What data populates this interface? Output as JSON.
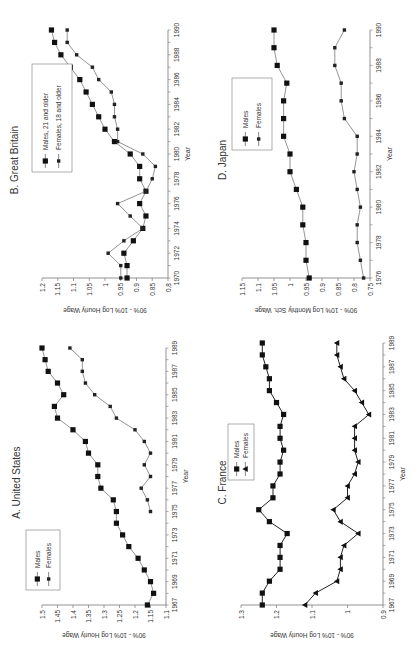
{
  "figure": {
    "orientation": "rotated-90-ccw"
  },
  "chart_data": [
    {
      "id": "us",
      "type": "line",
      "title": "A. United States",
      "xlabel": "Year",
      "ylabel": "90% - 10% Log Hourly Wage",
      "xlim": [
        1967,
        1989
      ],
      "ylim": [
        1.1,
        1.5
      ],
      "xticks": [
        1967,
        1969,
        1971,
        1973,
        1975,
        1977,
        1979,
        1981,
        1983,
        1985,
        1987,
        1989
      ],
      "yticks": [
        1.1,
        1.15,
        1.2,
        1.25,
        1.3,
        1.35,
        1.4,
        1.45,
        1.5
      ],
      "ytick_labels": [
        "1.1",
        "1.15",
        "1.2",
        "1.25",
        "1.3",
        "1.35",
        "1.4",
        "1.45",
        "1.5"
      ],
      "legend": [
        "Males",
        "Females"
      ],
      "legend_position": "bottom-left",
      "series": [
        {
          "name": "Males",
          "marker": "square",
          "x": [
            1967,
            1968,
            1969,
            1970,
            1971,
            1972,
            1973,
            1974,
            1975,
            1976,
            1977,
            1978,
            1979,
            1980,
            1981,
            1982,
            1983,
            1984,
            1985,
            1986,
            1987,
            1988,
            1989
          ],
          "values": [
            1.16,
            1.14,
            1.15,
            1.17,
            1.19,
            1.22,
            1.24,
            1.26,
            1.26,
            1.27,
            1.31,
            1.32,
            1.32,
            1.35,
            1.36,
            1.4,
            1.45,
            1.46,
            1.43,
            1.45,
            1.48,
            1.49,
            1.5
          ]
        },
        {
          "name": "Females",
          "marker": "small-diamond",
          "x": [
            1975,
            1976,
            1977,
            1978,
            1979,
            1980,
            1981,
            1982,
            1983,
            1984,
            1985,
            1986,
            1987,
            1988,
            1989
          ],
          "values": [
            1.15,
            1.16,
            1.18,
            1.15,
            1.17,
            1.15,
            1.17,
            1.2,
            1.26,
            1.28,
            1.33,
            1.36,
            1.37,
            1.37,
            1.41
          ]
        }
      ]
    },
    {
      "id": "gb",
      "type": "line",
      "title": "B. Great Britain",
      "xlabel": "Year",
      "ylabel": "90% - 10% Log Hourly Wage",
      "xlim": [
        1970,
        1990
      ],
      "ylim": [
        0.8,
        1.2
      ],
      "xticks": [
        1970,
        1972,
        1974,
        1976,
        1978,
        1980,
        1982,
        1984,
        1986,
        1988,
        1990
      ],
      "yticks": [
        0.8,
        0.85,
        0.9,
        0.95,
        1.0,
        1.05,
        1.1,
        1.15,
        1.2
      ],
      "ytick_labels": [
        "0.8",
        "0.85",
        "0.9",
        "0.95",
        "1",
        "1.05",
        "1.1",
        "1.15",
        "1.2"
      ],
      "legend": [
        "Males, 21 and older",
        "Females, 18 and older"
      ],
      "legend_position": "top-left",
      "series": [
        {
          "name": "Males, 21 and older",
          "marker": "square",
          "x": [
            1970,
            1971,
            1972,
            1973,
            1974,
            1975,
            1976,
            1977,
            1978,
            1979,
            1980,
            1981,
            1982,
            1983,
            1984,
            1985,
            1986,
            1987,
            1988,
            1989,
            1990
          ],
          "values": [
            0.93,
            0.93,
            0.94,
            0.91,
            0.88,
            0.87,
            0.89,
            0.87,
            0.89,
            0.89,
            0.92,
            0.97,
            1.0,
            1.02,
            1.04,
            1.06,
            1.08,
            1.11,
            1.14,
            1.16,
            1.17
          ]
        },
        {
          "name": "Females, 18 and older",
          "marker": "small-diamond",
          "x": [
            1970,
            1971,
            1972,
            1973,
            1974,
            1975,
            1976,
            1977,
            1978,
            1979,
            1980,
            1981,
            1982,
            1983,
            1984,
            1985,
            1986,
            1987,
            1988,
            1989,
            1990
          ],
          "values": [
            0.95,
            0.95,
            0.99,
            0.94,
            0.88,
            0.92,
            0.96,
            0.87,
            0.85,
            0.84,
            0.88,
            0.96,
            0.96,
            0.97,
            0.97,
            0.98,
            1.02,
            1.04,
            1.09,
            1.12,
            1.12
          ]
        }
      ]
    },
    {
      "id": "fr",
      "type": "line",
      "title": "C. France",
      "xlabel": "Year",
      "ylabel": "90% - 10% Log Hourly Wage",
      "xlim": [
        1967,
        1989
      ],
      "ylim": [
        0.9,
        1.3
      ],
      "xticks": [
        1967,
        1969,
        1971,
        1973,
        1975,
        1977,
        1979,
        1981,
        1983,
        1985,
        1987,
        1989
      ],
      "yticks": [
        0.9,
        1.0,
        1.1,
        1.2,
        1.3
      ],
      "ytick_labels": [
        "0.9",
        "1",
        "1.1",
        "1.2",
        "1.3"
      ],
      "legend": [
        "Males",
        "Females"
      ],
      "legend_position": "top-left",
      "series": [
        {
          "name": "Males",
          "marker": "square",
          "x": [
            1967,
            1968,
            1969,
            1970,
            1971,
            1972,
            1973,
            1974,
            1975,
            1976,
            1977,
            1978,
            1979,
            1980,
            1981,
            1982,
            1983,
            1984,
            1985,
            1986,
            1987,
            1988,
            1989
          ],
          "values": [
            1.24,
            1.24,
            1.22,
            1.19,
            1.19,
            1.19,
            1.17,
            1.22,
            1.25,
            1.21,
            1.21,
            1.19,
            1.19,
            1.18,
            1.19,
            1.19,
            1.18,
            1.2,
            1.22,
            1.22,
            1.23,
            1.24,
            1.24
          ]
        },
        {
          "name": "Females",
          "marker": "triangle",
          "x": [
            1967,
            1968,
            1969,
            1970,
            1971,
            1972,
            1973,
            1974,
            1975,
            1976,
            1977,
            1978,
            1979,
            1980,
            1981,
            1982,
            1983,
            1984,
            1985,
            1986,
            1987,
            1988,
            1989
          ],
          "values": [
            1.12,
            1.09,
            1.03,
            1.02,
            1.02,
            1.01,
            0.97,
            1.02,
            1.04,
            1.0,
            1.0,
            0.98,
            0.97,
            0.98,
            0.98,
            0.98,
            0.94,
            0.96,
            0.98,
            1.01,
            1.02,
            1.03,
            1.03
          ]
        }
      ]
    },
    {
      "id": "jp",
      "type": "line",
      "title": "D. Japan",
      "xlabel": "Year",
      "ylabel": "90% - 10% Log Monthly Sch. Wage",
      "xlim": [
        1976,
        1990
      ],
      "ylim": [
        0.75,
        1.15
      ],
      "xticks": [
        1976,
        1978,
        1980,
        1982,
        1984,
        1986,
        1988,
        1990
      ],
      "yticks": [
        0.75,
        0.8,
        0.85,
        0.9,
        0.95,
        1.0,
        1.05,
        1.1,
        1.15
      ],
      "ytick_labels": [
        "0.75",
        "0.8",
        "0.85",
        "0.9",
        "0.95",
        "1",
        "1.05",
        "1.1",
        "1.15"
      ],
      "legend": [
        "Males",
        "Females"
      ],
      "legend_position": "top-left",
      "series": [
        {
          "name": "Males",
          "marker": "square",
          "x": [
            1976,
            1977,
            1978,
            1979,
            1980,
            1981,
            1982,
            1983,
            1984,
            1985,
            1986,
            1987,
            1988,
            1989,
            1990
          ],
          "values": [
            0.94,
            0.95,
            0.95,
            0.96,
            0.96,
            0.98,
            1.0,
            1.0,
            1.02,
            1.02,
            1.02,
            1.01,
            1.04,
            1.05,
            1.05
          ]
        },
        {
          "name": "Females",
          "marker": "small-diamond",
          "x": [
            1976,
            1977,
            1978,
            1979,
            1980,
            1981,
            1982,
            1983,
            1984,
            1985,
            1986,
            1987,
            1988,
            1989,
            1990
          ],
          "values": [
            0.77,
            0.78,
            0.79,
            0.79,
            0.78,
            0.79,
            0.8,
            0.79,
            0.79,
            0.83,
            0.84,
            0.84,
            0.86,
            0.86,
            0.83
          ]
        }
      ]
    }
  ]
}
